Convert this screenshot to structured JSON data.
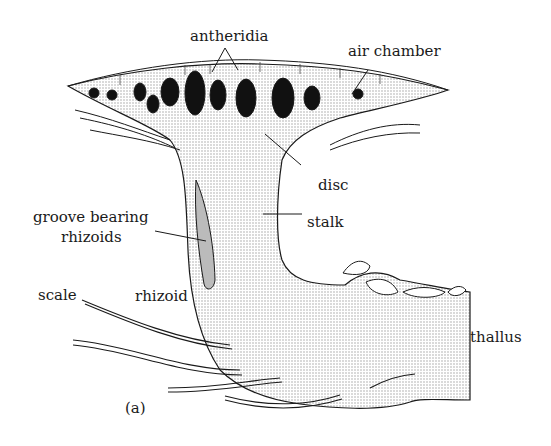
{
  "diagram": {
    "panel_label": "(a)",
    "labels": {
      "antheridia": "antheridia",
      "air_chamber": "air chamber",
      "disc": "disc",
      "stalk": "stalk",
      "groove": "groove bearing",
      "groove2": "rhizoids",
      "scale": "scale",
      "rhizoid": "rhizoid",
      "thallus": "thallus"
    },
    "colors": {
      "ink": "#1a1a1a",
      "stipple": "#d9d9d9",
      "antheridium_fill": "#111111"
    }
  }
}
